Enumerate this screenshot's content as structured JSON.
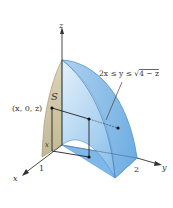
{
  "diagram": {
    "type": "3d-solid-region",
    "axes": {
      "x_label": "x",
      "y_label": "y",
      "z_label": "z"
    },
    "ticks": {
      "x_tick": "1",
      "y_tick": "2"
    },
    "labels": {
      "region_condition": "2x ≤ y ≤ √4 − z",
      "region_condition_prefix": "2x ≤ y ≤ √",
      "region_condition_radicand": "4 − z",
      "projection_label": "S",
      "point_label": "(x, 0, z)",
      "x_marker": "x"
    },
    "colors": {
      "solid_fill": "#8fc1ec",
      "solid_light": "#d6e9f8",
      "solid_edge": "#5a9bd5",
      "projection_fill": "#cdc3a6",
      "axis": "#333333",
      "point": "#111111"
    }
  }
}
